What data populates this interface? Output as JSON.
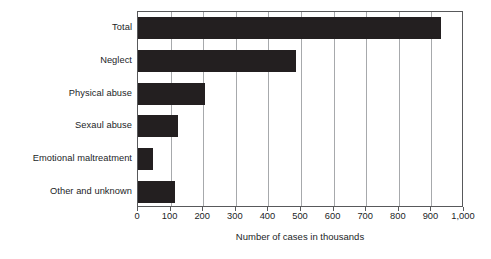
{
  "chart_data": {
    "type": "bar",
    "orientation": "horizontal",
    "title": "",
    "xlabel": "Number of cases in thousands",
    "ylabel": "",
    "categories": [
      "Total",
      "Neglect",
      "Physical abuse",
      "Sexaul abuse",
      "Emotional maltreatment",
      "Other and unknown"
    ],
    "values": [
      930,
      485,
      207,
      122,
      47,
      115
    ],
    "xlim": [
      0,
      1000
    ],
    "xticks": [
      0,
      100,
      200,
      300,
      400,
      500,
      600,
      700,
      800,
      900,
      1000
    ],
    "xtick_labels": [
      "0",
      "100",
      "200",
      "300",
      "400",
      "500",
      "600",
      "700",
      "800",
      "900",
      "1,000"
    ],
    "grid": "vertical",
    "legend": "none",
    "bar_color": "#231f20",
    "grid_color": "#a7a9ac",
    "frame_color": "#58595b",
    "background_color": "#ffffff"
  }
}
